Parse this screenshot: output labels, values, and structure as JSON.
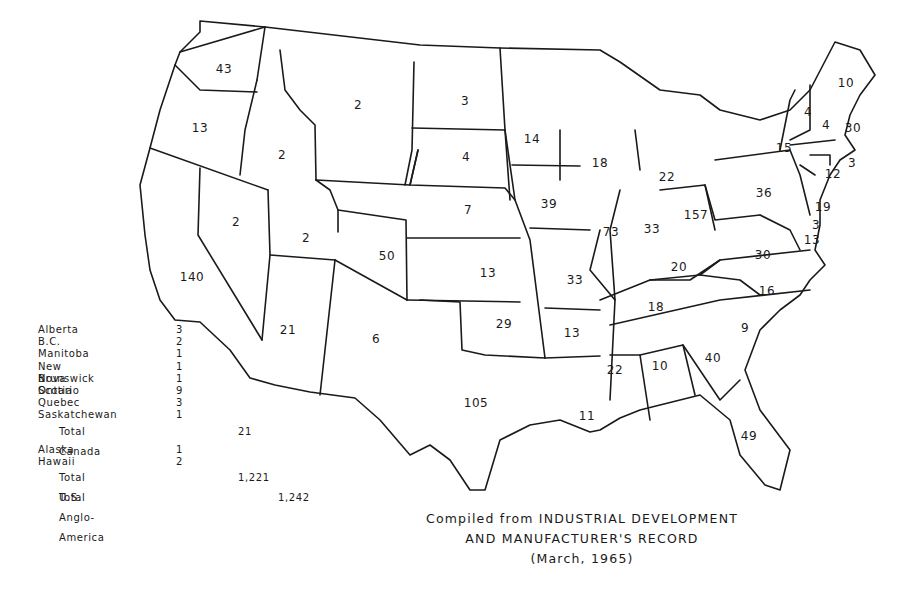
{
  "map": {
    "subject": "Count by state/province, United States and Canada (Anglo-America)",
    "source_caption": {
      "line1": "Compiled from INDUSTRIAL DEVELOPMENT",
      "line2": "AND MANUFACTURER'S RECORD",
      "line3": "(March, 1965)"
    },
    "states": {
      "washington": "43",
      "oregon": "13",
      "california": "140",
      "idaho": "2",
      "nevada": "2",
      "montana": "2",
      "wyoming": "",
      "utah": "2",
      "arizona": "21",
      "colorado": "50",
      "new_mexico": "6",
      "north_dakota": "3",
      "south_dakota": "4",
      "nebraska": "7",
      "kansas": "13",
      "oklahoma": "29",
      "texas": "105",
      "minnesota": "14",
      "iowa": "39",
      "missouri": "33",
      "arkansas": "13",
      "louisiana": "11",
      "wisconsin": "18",
      "illinois": "73",
      "michigan": "22",
      "indiana": "33",
      "ohio": "157",
      "kentucky": "20",
      "tennessee": "18",
      "mississippi": "22",
      "alabama": "10",
      "georgia": "40",
      "florida": "49",
      "south_carolina": "9",
      "north_carolina": "16",
      "virginia": "30",
      "west_virginia": "",
      "pennsylvania": "36",
      "new_york": "15",
      "vermont": "4",
      "new_hampshire": "4",
      "maine": "10",
      "massachusetts": "30",
      "rhode_island": "3",
      "connecticut": "12",
      "new_jersey": "19",
      "delaware": "3",
      "maryland": "13"
    },
    "legend": {
      "canada": [
        {
          "name": "Alberta",
          "value": "3"
        },
        {
          "name": "B.C.",
          "value": "2"
        },
        {
          "name": "Manitoba",
          "value": "1"
        },
        {
          "name": "New Brunswick",
          "value": "1"
        },
        {
          "name": "Nova Scotia",
          "value": "1"
        },
        {
          "name": "Ontario",
          "value": "9"
        },
        {
          "name": "Quebec",
          "value": "3"
        },
        {
          "name": "Saskatchewan",
          "value": "1"
        }
      ],
      "total_canada": {
        "label": "Total Canada",
        "value": "21"
      },
      "other_us": [
        {
          "name": "Alaska",
          "value": "1"
        },
        {
          "name": "Hawaii",
          "value": "2"
        }
      ],
      "total_us": {
        "label": "Total U.S.",
        "value": "1,221"
      },
      "total_anglo_america": {
        "label": "Total Anglo-America",
        "value": "1,242"
      }
    }
  }
}
